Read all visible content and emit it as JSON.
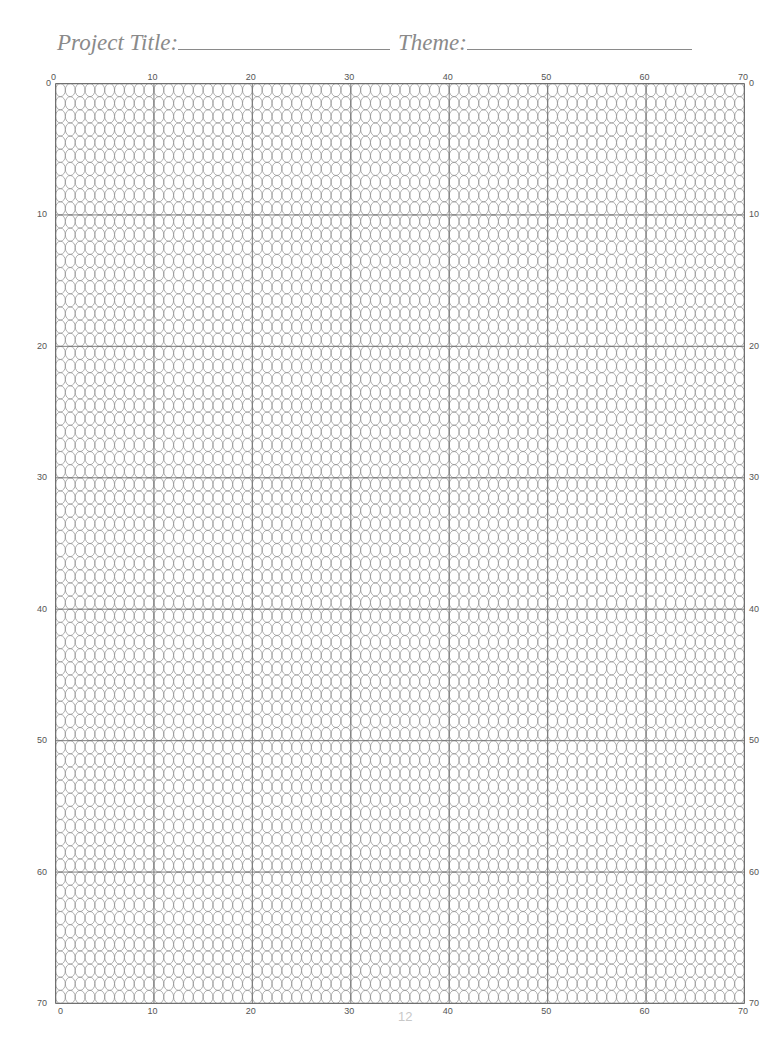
{
  "header": {
    "project_title_label": "Project Title:",
    "theme_label": "Theme:"
  },
  "grid": {
    "columns": 70,
    "rows": 70,
    "cell_shape": "oval",
    "line_color": "#8c8c8c",
    "major_line_color": "#707070",
    "major_every": 10,
    "top_ticks": [
      "0",
      "10",
      "20",
      "30",
      "40",
      "50",
      "60",
      "70"
    ],
    "bottom_ticks": [
      "0",
      "10",
      "20",
      "30",
      "40",
      "50",
      "60",
      "70"
    ],
    "left_ticks": [
      "0",
      "10",
      "20",
      "30",
      "40",
      "50",
      "60",
      "70"
    ],
    "right_ticks": [
      "0",
      "10",
      "20",
      "30",
      "40",
      "50",
      "60",
      "70"
    ]
  },
  "footer": {
    "page_number": "12"
  }
}
